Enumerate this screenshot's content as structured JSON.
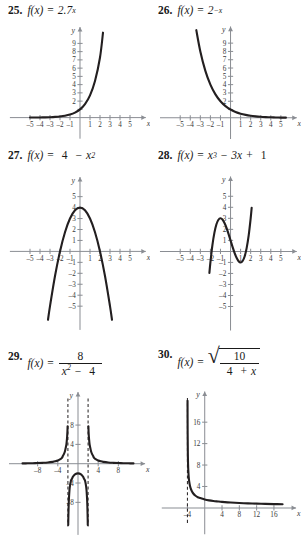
{
  "page": {
    "background": "#ffffff",
    "curve_color": "#231f20",
    "axis_color": "#8a8d93"
  },
  "problems": [
    {
      "number": "25.",
      "fn": "f(x)",
      "eq": "=",
      "expr_kind": "power",
      "base": "2.7",
      "exponent": "x",
      "chart_data": {
        "type": "line",
        "title": "f(x) = 2.7^x",
        "xlabel": "x",
        "ylabel": "y",
        "xlim": [
          -5.8,
          5.8
        ],
        "ylim": [
          -1.2,
          10.2
        ],
        "xticks": [
          -5,
          -4,
          -3,
          -2,
          -1,
          1,
          2,
          3,
          4,
          5
        ],
        "xticklabels": [
          "-5",
          "-4",
          "-3",
          "-2",
          "-1",
          "1",
          "2",
          "3",
          "4",
          "5"
        ],
        "yticks": [
          1,
          2,
          3,
          4,
          5,
          6,
          7,
          8,
          9
        ],
        "yticklabels": [
          "",
          "2",
          "3",
          "4",
          "5",
          "6",
          "7",
          "8",
          "9"
        ],
        "grid": false,
        "legend": "none",
        "series": [
          {
            "name": "2.7^x",
            "x": [
              -5.0,
              -4.5,
              -4.0,
              -3.5,
              -3.0,
              -2.5,
              -2.0,
              -1.5,
              -1.0,
              -0.5,
              0.0,
              0.5,
              1.0,
              1.5,
              2.0,
              2.3
            ],
            "y": [
              0.007,
              0.011,
              0.019,
              0.031,
              0.051,
              0.083,
              0.137,
              0.225,
              0.37,
              0.609,
              1.0,
              1.643,
              2.7,
              4.437,
              7.29,
              10.3
            ]
          }
        ]
      }
    },
    {
      "number": "26.",
      "fn": "f(x)",
      "eq": "=",
      "expr_kind": "power",
      "base": "2",
      "exponent": "−x",
      "chart_data": {
        "type": "line",
        "title": "f(x) = 2^-x",
        "xlabel": "x",
        "ylabel": "y",
        "xlim": [
          -5.8,
          5.8
        ],
        "ylim": [
          -1.2,
          10.2
        ],
        "xticks": [
          -5,
          -4,
          -3,
          -2,
          -1,
          1,
          2,
          3,
          4,
          5
        ],
        "xticklabels": [
          "-5",
          "-4",
          "-3",
          "-2",
          "-1",
          "1",
          "2",
          "3",
          "4",
          "5"
        ],
        "yticks": [
          1,
          2,
          3,
          4,
          5,
          6,
          7,
          8,
          9
        ],
        "yticklabels": [
          "",
          "2",
          "3",
          "4",
          "5",
          "6",
          "7",
          "8",
          "9"
        ],
        "grid": false,
        "legend": "none",
        "series": [
          {
            "name": "2^-x",
            "x": [
              -3.4,
              -3.0,
              -2.5,
              -2.0,
              -1.5,
              -1.0,
              -0.5,
              0.0,
              0.5,
              1.0,
              1.5,
              2.0,
              2.5,
              3.0,
              3.5,
              4.0,
              4.5,
              5.0,
              5.5
            ],
            "y": [
              10.56,
              8.0,
              5.657,
              4.0,
              2.828,
              2.0,
              1.414,
              1.0,
              0.707,
              0.5,
              0.354,
              0.25,
              0.177,
              0.125,
              0.088,
              0.063,
              0.044,
              0.031,
              0.022
            ]
          }
        ]
      }
    },
    {
      "number": "27.",
      "fn": "f(x)",
      "eq": "=",
      "expr_kind": "quadratic",
      "lead": "4",
      "minus": "−",
      "term": "x",
      "exponent": "2",
      "chart_data": {
        "type": "line",
        "title": "f(x) = 4 - x^2",
        "xlabel": "x",
        "ylabel": "y",
        "xlim": [
          -5.8,
          5.8
        ],
        "ylim": [
          -6.4,
          6.2
        ],
        "xticks": [
          -5,
          -4,
          -3,
          -2,
          -1,
          1,
          2,
          3,
          4,
          5
        ],
        "xticklabels": [
          "-5",
          "-4",
          "-3",
          "-2",
          "-1",
          "1",
          "2",
          "3",
          "4",
          "5"
        ],
        "yticks": [
          -5,
          -4,
          -3,
          -2,
          -1,
          1,
          2,
          3,
          4,
          5
        ],
        "yticklabels": [
          "-5",
          "-4",
          "-3",
          "-2",
          "-1",
          "1",
          "2",
          "3",
          "4",
          "5"
        ],
        "grid": false,
        "legend": "none",
        "vertex": [
          0,
          4
        ],
        "roots": [
          -2,
          2
        ],
        "series": [
          {
            "name": "4 - x^2",
            "x": [
              -3.2,
              -3.0,
              -2.5,
              -2.0,
              -1.5,
              -1.0,
              -0.5,
              0.0,
              0.5,
              1.0,
              1.5,
              2.0,
              2.5,
              3.0,
              3.2
            ],
            "y": [
              -6.24,
              -5.0,
              -2.25,
              0.0,
              1.75,
              3.0,
              3.75,
              4.0,
              3.75,
              3.0,
              1.75,
              0.0,
              -2.25,
              -5.0,
              -6.24
            ]
          }
        ]
      }
    },
    {
      "number": "28.",
      "fn": "f(x)",
      "eq": "=",
      "expr_kind": "cubic",
      "term1": "x",
      "exp1": "3",
      "op1": "−",
      "term2": "3x",
      "op2": "+",
      "term3": "1",
      "chart_data": {
        "type": "line",
        "title": "f(x) = x^3 - 3x + 1",
        "xlabel": "x",
        "ylabel": "y",
        "xlim": [
          -5.8,
          5.8
        ],
        "ylim": [
          -6.4,
          6.2
        ],
        "xticks": [
          -5,
          -4,
          -3,
          -2,
          -1,
          1,
          2,
          3,
          4,
          5
        ],
        "xticklabels": [
          "-5",
          "-4",
          "-3",
          "-2",
          "-1",
          "1",
          "2",
          "3",
          "4",
          "5"
        ],
        "yticks": [
          -5,
          -4,
          -3,
          -2,
          -1,
          1,
          2,
          3,
          4,
          5
        ],
        "yticklabels": [
          "-5",
          "-4",
          "-3",
          "-2",
          "-1",
          "1",
          "2",
          "3",
          "4",
          "5"
        ],
        "grid": false,
        "legend": "none",
        "local_max": [
          -1,
          3
        ],
        "local_min": [
          1,
          -1
        ],
        "series": [
          {
            "name": "x^3 - 3x + 1",
            "x": [
              -2.1,
              -2.0,
              -1.8,
              -1.6,
              -1.4,
              -1.2,
              -1.0,
              -0.8,
              -0.6,
              -0.4,
              -0.2,
              0.0,
              0.2,
              0.4,
              0.6,
              0.8,
              1.0,
              1.2,
              1.4,
              1.6,
              1.8,
              2.0,
              2.1
            ],
            "y": [
              -1.96,
              -1.0,
              0.57,
              1.7,
              2.46,
              2.87,
              3.0,
              2.89,
              2.58,
              2.14,
              1.59,
              1.0,
              0.41,
              -0.14,
              -0.58,
              -0.89,
              -1.0,
              -0.87,
              -0.46,
              0.3,
              1.43,
              3.0,
              3.96
            ]
          }
        ]
      }
    },
    {
      "number": "29.",
      "fn": "f(x)",
      "eq": "=",
      "expr_kind": "fraction",
      "numerator": "8",
      "den_term": "x",
      "den_exp": "2",
      "den_op": "−",
      "den_const": "4",
      "chart_data": {
        "type": "line",
        "title": "f(x) = 8/(x^2 - 4)",
        "xlabel": "x",
        "ylabel": "y",
        "xlim": [
          -11.5,
          11.5
        ],
        "ylim": [
          -13.0,
          13.5
        ],
        "xticks": [
          -8,
          -4,
          4,
          8
        ],
        "xticklabels": [
          "-8",
          "-4",
          "4",
          "8"
        ],
        "yticks": [
          -8,
          -4,
          4,
          8
        ],
        "yticklabels": [
          "-8",
          "-4",
          "4",
          "8"
        ],
        "grid": false,
        "legend": "none",
        "asymptotes_vertical": [
          -2,
          2
        ],
        "asymptote_horizontal": 0,
        "series": [
          {
            "name": "left-branch",
            "x": [
              -11.0,
              -10.0,
              -9.0,
              -8.0,
              -7.0,
              -6.0,
              -5.0,
              -4.5,
              -4.0,
              -3.5,
              -3.2,
              -3.0,
              -2.8,
              -2.6,
              -2.45,
              -2.3,
              -2.2,
              -2.15,
              -2.1,
              -2.06
            ],
            "y": [
              0.068,
              0.083,
              0.104,
              0.133,
              0.178,
              0.25,
              0.381,
              0.494,
              0.667,
              0.941,
              1.19,
              1.6,
              1.98,
              2.53,
              3.22,
              4.01,
              5.0,
              5.68,
              6.58,
              7.75
            ]
          },
          {
            "name": "middle-branch",
            "x": [
              -1.94,
              -1.9,
              -1.85,
              -1.8,
              -1.7,
              -1.6,
              -1.4,
              -1.2,
              -1.0,
              -0.6,
              0.0,
              0.6,
              1.0,
              1.2,
              1.4,
              1.6,
              1.7,
              1.8,
              1.85,
              1.9,
              1.94
            ],
            "y": [
              -12.7,
              -10.5,
              -8.6,
              -7.3,
              -5.6,
              -4.65,
              -3.54,
              -3.12,
              -2.67,
              -2.19,
              -2.0,
              -2.19,
              -2.67,
              -3.12,
              -3.54,
              -4.65,
              -5.6,
              -7.3,
              -8.6,
              -10.5,
              -12.7
            ]
          },
          {
            "name": "right-branch",
            "x": [
              2.06,
              2.1,
              2.15,
              2.2,
              2.3,
              2.45,
              2.6,
              2.8,
              3.0,
              3.2,
              3.5,
              4.0,
              4.5,
              5.0,
              6.0,
              7.0,
              8.0,
              9.0,
              10.0,
              11.0
            ],
            "y": [
              7.75,
              6.58,
              5.68,
              5.0,
              4.01,
              3.22,
              2.53,
              1.98,
              1.6,
              1.19,
              0.941,
              0.667,
              0.494,
              0.381,
              0.25,
              0.178,
              0.133,
              0.104,
              0.083,
              0.068
            ]
          }
        ]
      }
    },
    {
      "number": "30.",
      "fn": "f(x)",
      "eq": "=",
      "expr_kind": "sqrt-fraction",
      "numerator": "10",
      "den_a": "4",
      "den_op": "+",
      "den_b": "x",
      "chart_data": {
        "type": "line",
        "title": "f(x) = sqrt(10/(4 + x))",
        "xlabel": "x",
        "ylabel": "y",
        "xlim": [
          -6.6,
          19.0
        ],
        "ylim": [
          -2.8,
          20.5
        ],
        "xticks": [
          -4,
          4,
          8,
          12,
          16
        ],
        "xticklabels": [
          "-4",
          "4",
          "8",
          "12",
          "16"
        ],
        "yticks": [
          4,
          8,
          12,
          16
        ],
        "yticklabels": [
          "4",
          "8",
          "12",
          "16"
        ],
        "grid": false,
        "legend": "none",
        "asymptotes_vertical": [
          -4
        ],
        "asymptote_horizontal": 0,
        "series": [
          {
            "name": "sqrt(10/(4+x))",
            "x": [
              -3.975,
              -3.95,
              -3.9,
              -3.85,
              -3.8,
              -3.7,
              -3.6,
              -3.4,
              -3.2,
              -3.0,
              -2.6,
              -2.2,
              -1.6,
              -1.0,
              0.0,
              1.0,
              2.0,
              3.0,
              4.0,
              6.0,
              8.0,
              10.0,
              12.0,
              14.0,
              16.0,
              18.0
            ],
            "y": [
              20.0,
              14.14,
              10.0,
              8.16,
              7.07,
              5.77,
              5.0,
              4.08,
              3.54,
              3.16,
              2.64,
              2.31,
              1.98,
              1.83,
              1.58,
              1.41,
              1.29,
              1.2,
              1.12,
              1.0,
              0.91,
              0.85,
              0.79,
              0.75,
              0.707,
              0.674
            ]
          }
        ]
      }
    }
  ]
}
